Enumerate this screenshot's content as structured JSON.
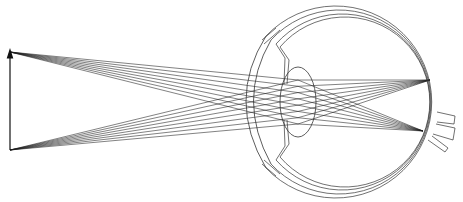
{
  "diagram": {
    "title": "Image formation in the human eye",
    "object": {
      "label": "Object arrow",
      "base": [
        10,
        150
      ],
      "tip": [
        10,
        52
      ]
    },
    "ray_fans": [
      {
        "name": "rays-from-tip",
        "origin": [
          10,
          52
        ],
        "target": [
          430,
          80
        ],
        "count": 8
      },
      {
        "name": "rays-from-base",
        "origin": [
          10,
          150
        ],
        "target": [
          423,
          131
        ],
        "count": 8
      }
    ],
    "eye": {
      "globe_center": [
        348,
        98
      ],
      "globe_radius": 94,
      "cornea_center": [
        300,
        100
      ],
      "lens_center": [
        320,
        102
      ],
      "optic_nerve": "right side"
    },
    "colors": {
      "ink": "#1a1a1a",
      "background": "#ffffff"
    }
  }
}
